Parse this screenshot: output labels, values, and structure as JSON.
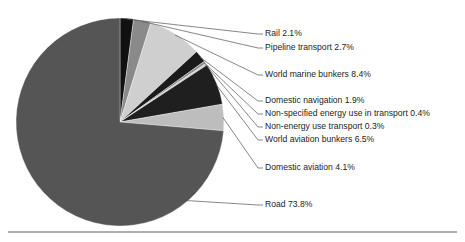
{
  "chart_data": {
    "type": "pie",
    "title": "",
    "subtitle": "",
    "xlabel": "",
    "ylabel": "",
    "legend_position": "callout-labels-right",
    "grid": false,
    "units": "percent",
    "total": 100.2,
    "start_angle_deg": -90,
    "direction": "clockwise",
    "categories": [
      "Rail",
      "Pipeline transport",
      "World marine bunkers",
      "Domestic navigation",
      "Non-specified energy use in transport",
      "Non-energy use transport",
      "World aviation bunkers",
      "Domestic aviation",
      "Road"
    ],
    "values": [
      2.1,
      2.7,
      8.4,
      1.9,
      0.4,
      0.3,
      6.5,
      4.1,
      73.8
    ],
    "colors": [
      "#111111",
      "#8a8a8a",
      "#cfcfcf",
      "#1a1a1a",
      "#8a8a8a",
      "#cfcfcf",
      "#1f1f1f",
      "#bdbdbd",
      "#555555"
    ],
    "slices": [
      {
        "label": "Rail",
        "value": 2.1,
        "display": "Rail 2.1%",
        "color": "#111111",
        "label_y": 34
      },
      {
        "label": "Pipeline transport",
        "value": 2.7,
        "display": "Pipeline transport 2.7%",
        "color": "#8a8a8a",
        "label_y": 48
      },
      {
        "label": "World marine bunkers",
        "value": 8.4,
        "display": "World marine bunkers 8.4%",
        "color": "#cfcfcf",
        "label_y": 75
      },
      {
        "label": "Domestic navigation",
        "value": 1.9,
        "display": "Domestic navigation 1.9%",
        "color": "#1a1a1a",
        "label_y": 101
      },
      {
        "label": "Non-specified energy use in transport",
        "value": 0.4,
        "display": "Non-specified energy use in transport 0.4%",
        "color": "#8a8a8a",
        "label_y": 114
      },
      {
        "label": "Non-energy use transport",
        "value": 0.3,
        "display": "Non-energy use transport 0.3%",
        "color": "#cfcfcf",
        "label_y": 127
      },
      {
        "label": "World aviation bunkers",
        "value": 6.5,
        "display": "World aviation bunkers 6.5%",
        "color": "#1f1f1f",
        "label_y": 140
      },
      {
        "label": "Domestic aviation",
        "value": 4.1,
        "display": "Domestic aviation 4.1%",
        "color": "#bdbdbd",
        "label_y": 168
      },
      {
        "label": "Road",
        "value": 73.8,
        "display": "Road 73.8%",
        "color": "#555555",
        "label_y": 205
      }
    ]
  },
  "geometry": {
    "cx": 120,
    "cy": 122,
    "r": 104,
    "label_x": 265,
    "elbow_x": 258,
    "rule_y": 232
  }
}
